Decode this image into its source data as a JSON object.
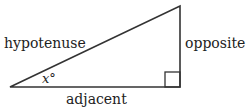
{
  "diagram": {
    "labels": {
      "hypotenuse": "hypotenuse",
      "opposite": "opposite",
      "adjacent": "adjacent",
      "angle": "x°"
    },
    "stroke_color": "#333333"
  }
}
